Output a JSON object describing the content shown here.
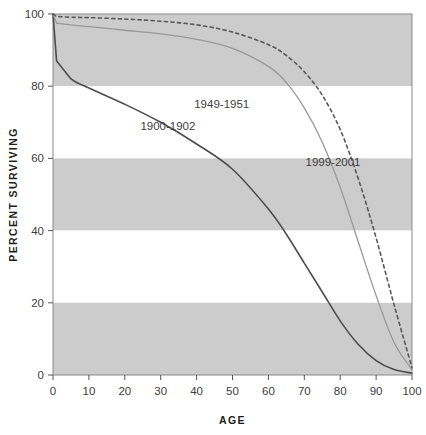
{
  "chart_data": {
    "type": "line",
    "title": "",
    "xlabel": "AGE",
    "ylabel": "PERCENT SURVIVING",
    "xlim": [
      0,
      100
    ],
    "ylim": [
      0,
      100
    ],
    "x_ticks": [
      0,
      10,
      20,
      30,
      40,
      50,
      60,
      70,
      80,
      90,
      100
    ],
    "y_ticks": [
      0,
      20,
      40,
      60,
      80,
      100
    ],
    "grid": false,
    "banded_background": true,
    "bands": [
      {
        "from": 80,
        "to": 100,
        "color": "#cccccc"
      },
      {
        "from": 60,
        "to": 80,
        "color": "#ffffff"
      },
      {
        "from": 40,
        "to": 60,
        "color": "#cccccc"
      },
      {
        "from": 20,
        "to": 40,
        "color": "#ffffff"
      },
      {
        "from": 0,
        "to": 20,
        "color": "#cccccc"
      }
    ],
    "legend_position": "inline-annotations",
    "x": [
      0,
      1,
      5,
      10,
      20,
      30,
      40,
      50,
      60,
      65,
      70,
      75,
      80,
      85,
      90,
      95,
      100
    ],
    "series": [
      {
        "name": "1900-1902",
        "label": "1900-1902",
        "style": "solid",
        "color": "#4d4d4d",
        "width": 1.6,
        "label_x": 32,
        "label_y": 68,
        "values": [
          100,
          87,
          82,
          79.5,
          75,
          70,
          64,
          57,
          46,
          39,
          31,
          23,
          15,
          8.5,
          4,
          1.5,
          0.5
        ]
      },
      {
        "name": "1949-1951",
        "label": "1949-1951",
        "style": "solid",
        "color": "#999999",
        "width": 1.3,
        "label_x": 47,
        "label_y": 74,
        "values": [
          100,
          97.5,
          97,
          96.5,
          95.5,
          94.5,
          93,
          90.5,
          85.5,
          81,
          74,
          64.5,
          52,
          37,
          22,
          9,
          1.5
        ]
      },
      {
        "name": "1999-2001",
        "label": "1999-2001",
        "style": "dashed",
        "color": "#595959",
        "width": 1.6,
        "label_x": 78,
        "label_y": 58,
        "values": [
          100,
          99.3,
          99.1,
          99,
          98.6,
          98,
          97,
          95,
          91.5,
          88.5,
          84,
          77.5,
          68,
          54.5,
          38,
          19.5,
          2
        ]
      }
    ]
  },
  "axis": {
    "x_title": "AGE",
    "y_title": "PERCENT SURVIVING",
    "x_tick_labels": [
      "0",
      "10",
      "20",
      "30",
      "40",
      "50",
      "60",
      "70",
      "80",
      "90",
      "100"
    ],
    "y_tick_labels": [
      "0",
      "20",
      "40",
      "60",
      "80",
      "100"
    ]
  },
  "labels": {
    "series_1900": "1900-1902",
    "series_1949": "1949-1951",
    "series_1999": "1999-2001"
  },
  "colors": {
    "band_gray": "#cccccc",
    "band_white": "#ffffff",
    "frame": "#808080",
    "text": "#3d3d3d",
    "line_1900": "#4d4d4d",
    "line_1949": "#999999",
    "line_1999": "#595959"
  }
}
